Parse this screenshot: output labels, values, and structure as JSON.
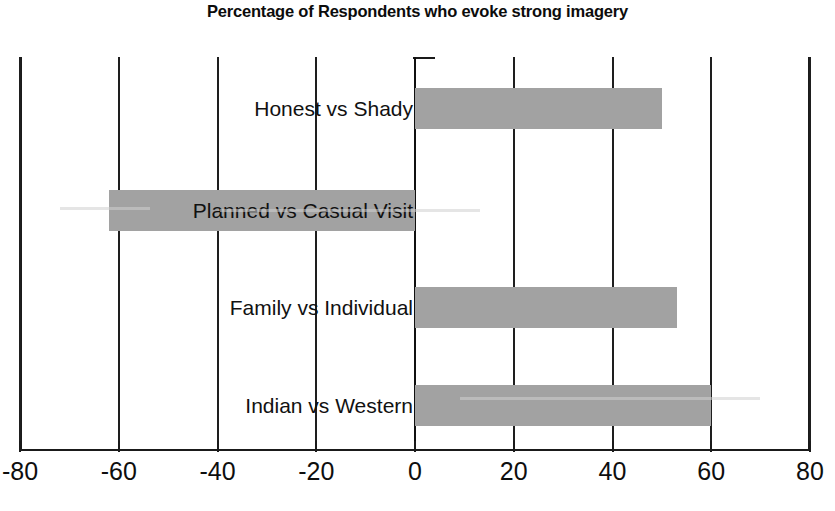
{
  "chart_data": {
    "type": "bar",
    "orientation": "horizontal",
    "title": "Percentage of Respondents who evoke strong imagery",
    "subtitle": "",
    "xlabel": "",
    "ylabel": "",
    "categories": [
      "Honest vs Shady",
      "Planned vs Casual Visit",
      "Family vs Individual",
      "Indian vs Western"
    ],
    "values": [
      50,
      -62,
      53,
      60
    ],
    "xlim": [
      -80,
      80
    ],
    "xticks": [
      -80,
      -60,
      -40,
      -20,
      0,
      20,
      40,
      60,
      80
    ],
    "xtick_labels": [
      "-80",
      "-60",
      "-40",
      "-20",
      "0",
      "20",
      "40",
      "60",
      "80"
    ],
    "grid": true,
    "grid_axis": "x",
    "legend": false,
    "legend_position": "none",
    "bar_color": "#a2a2a2",
    "axis_color": "#1a1a1a",
    "background_color": "#ffffff",
    "zero_reference": 0
  },
  "axis": {
    "tick_labels": [
      "-80",
      "-60",
      "-40",
      "-20",
      "0",
      "20",
      "40",
      "60",
      "80"
    ]
  },
  "bars": [
    {
      "label": "Honest vs Shady",
      "value": 50,
      "value_text": "50"
    },
    {
      "label": "Planned vs Casual Visit",
      "value": -62,
      "value_text": "-62"
    },
    {
      "label": "Family vs Individual",
      "value": 53,
      "value_text": "53"
    },
    {
      "label": "Indian vs Western",
      "value": 60,
      "value_text": "60"
    }
  ]
}
